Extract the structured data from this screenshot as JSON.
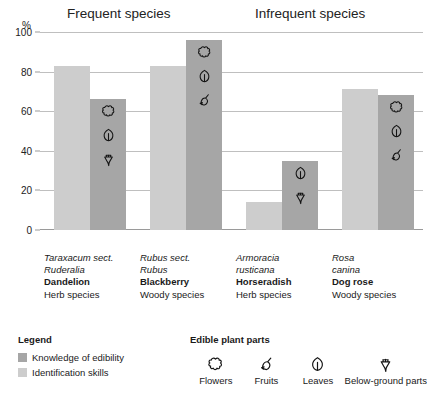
{
  "chart_data": {
    "type": "bar",
    "title": "",
    "xlabel": "",
    "ylabel": "%",
    "ylim": [
      0,
      100
    ],
    "ytick_values": [
      0,
      20,
      40,
      60,
      80,
      100
    ],
    "ytick_labels": [
      "0",
      "20",
      "40",
      "60",
      "80",
      "100"
    ],
    "grid": true,
    "legend_position": "bottom-left",
    "group_headers": [
      {
        "label": "Frequent species",
        "span": [
          "Dandelion",
          "Blackberry"
        ]
      },
      {
        "label": "Infrequent species",
        "span": [
          "Horseradish",
          "Dog rose"
        ]
      }
    ],
    "categories": [
      "Dandelion",
      "Blackberry",
      "Horseradish",
      "Dog rose"
    ],
    "series": [
      {
        "name": "Identification skills",
        "color": "#cdcdcd",
        "values": [
          83,
          83,
          14,
          71
        ]
      },
      {
        "name": "Knowledge of edibility",
        "color": "#a6a6a6",
        "values": [
          66,
          96,
          35,
          68
        ]
      }
    ],
    "category_details": [
      {
        "latin_line1": "Taraxacum sect.",
        "latin_line2": "Ruderalia",
        "common": "Dandelion",
        "habit": "Herb species",
        "edible_parts": [
          "flowers",
          "leaves",
          "below-ground"
        ]
      },
      {
        "latin_line1": "Rubus sect.",
        "latin_line2": "Rubus",
        "common": "Blackberry",
        "habit": "Woody species",
        "edible_parts": [
          "flowers",
          "leaves",
          "fruits"
        ]
      },
      {
        "latin_line1": "Armoracia",
        "latin_line2": "rusticana",
        "common": "Horseradish",
        "habit": "Herb species",
        "edible_parts": [
          "leaves",
          "below-ground"
        ]
      },
      {
        "latin_line1": "Rosa",
        "latin_line2": "canina",
        "common": "Dog rose",
        "habit": "Woody species",
        "edible_parts": [
          "flowers",
          "leaves",
          "fruits"
        ]
      }
    ]
  },
  "axis": {
    "unit_label": "%",
    "tick_100": "100",
    "tick_80": "80",
    "tick_60": "60",
    "tick_40": "40",
    "tick_20": "20",
    "tick_0": "0"
  },
  "headers": {
    "frequent": "Frequent species",
    "infrequent": "Infrequent species"
  },
  "legend_left": {
    "title": "Legend",
    "items": [
      {
        "label": "Knowledge of edibility",
        "color": "#a6a6a6"
      },
      {
        "label": "Identification skills",
        "color": "#cdcdcd"
      }
    ]
  },
  "legend_right": {
    "title": "Edible plant parts",
    "items": [
      {
        "label": "Flowers",
        "icon": "flower-icon"
      },
      {
        "label": "Fruits",
        "icon": "fruit-icon"
      },
      {
        "label": "Leaves",
        "icon": "leaf-icon"
      },
      {
        "label": "Below-ground parts",
        "icon": "root-icon"
      }
    ]
  },
  "categories_text": {
    "c0_latin1": "Taraxacum sect.",
    "c0_latin2": "Ruderalia",
    "c0_common": "Dandelion",
    "c0_habit": "Herb species",
    "c1_latin1": "Rubus sect.",
    "c1_latin2": "Rubus",
    "c1_common": "Blackberry",
    "c1_habit": "Woody species",
    "c2_latin1": "Armoracia",
    "c2_latin2": "rusticana",
    "c2_common": "Horseradish",
    "c2_habit": "Herb species",
    "c3_latin1": "Rosa",
    "c3_latin2": "canina",
    "c3_common": "Dog rose",
    "c3_habit": "Woody species"
  }
}
